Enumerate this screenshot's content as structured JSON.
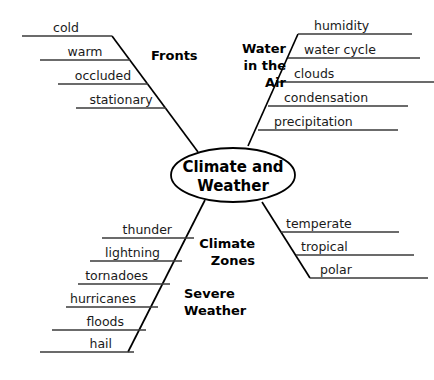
{
  "diagram": {
    "type": "fishbone-concept-map",
    "center": {
      "line1": "Climate  and",
      "line2": "Weather"
    },
    "branches": [
      {
        "id": "fronts",
        "label": "Fronts",
        "label_lines": [
          "Fronts"
        ],
        "position": "top-left",
        "items": [
          "cold",
          "warm",
          "occluded",
          "stationary"
        ]
      },
      {
        "id": "water-in-the-air",
        "label": "Water in the Air",
        "label_lines": [
          "Water",
          "in  the",
          "Air"
        ],
        "position": "top-right",
        "items": [
          "humidity",
          "water cycle",
          "clouds",
          "condensation",
          "precipitation"
        ]
      },
      {
        "id": "severe-weather",
        "label": "Severe Weather",
        "label_lines": [
          "Severe",
          "Weather"
        ],
        "position": "bottom-left",
        "items": [
          "thunder",
          "lightning",
          "tornadoes",
          "hurricanes",
          "floods",
          "hail"
        ]
      },
      {
        "id": "climate-zones",
        "label": "Climate Zones",
        "label_lines": [
          "Climate",
          "Zones"
        ],
        "position": "bottom-right",
        "items": [
          "temperate",
          "tropical",
          "polar"
        ]
      }
    ],
    "colors": {
      "background": "#ffffff",
      "stroke": "#000000",
      "bone_stroke": "#3a3a3a",
      "text": "#1a1a1a"
    }
  }
}
